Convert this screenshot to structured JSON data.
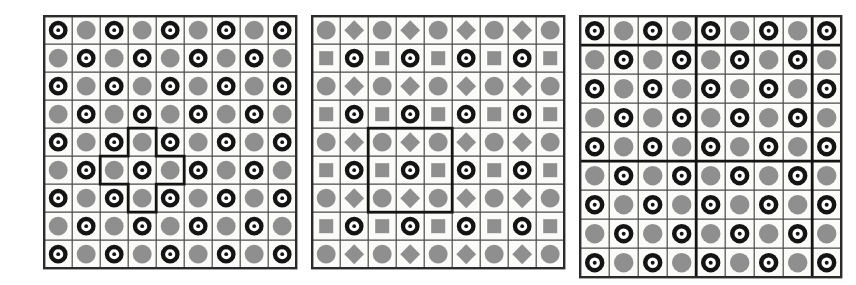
{
  "figure": {
    "background_color": "#ffffff",
    "width": 856,
    "height": 285
  },
  "palette": {
    "ink": "#1a1a1a",
    "thin_line": "#4a4a4a",
    "thick_line": "#141414",
    "panel_border": "#2b2b2b",
    "cell_background": "#fbfbfa",
    "gray_fill": "#8f8f8f",
    "gray_fill_dark": "#858585",
    "ring_stroke": "#141414",
    "ring_inner": "#ffffff",
    "dot_fill": "#141414"
  },
  "glyphs": {
    "ring_dot": {
      "name": "ring-dot-glyph",
      "description": "Thick black annulus with white interior and small black center dot"
    },
    "gray_circle": {
      "name": "gray-circle-glyph",
      "description": "Solid medium gray filled circle"
    },
    "gray_square": {
      "name": "gray-square-glyph",
      "description": "Solid medium gray filled square"
    },
    "gray_diamond": {
      "name": "gray-diamond-glyph",
      "description": "Solid medium gray filled diamond (rotated square)"
    }
  },
  "panels": [
    {
      "id": "panel-left",
      "label": "Left grid",
      "x": 42,
      "y": 14,
      "cell": 28,
      "rows": 9,
      "cols": 9,
      "thin_line_width": 1.2,
      "border_width": 2.4,
      "thick_line_width": 0,
      "thick_rows": [],
      "thick_cols": [],
      "cells": [
        [
          "ring_dot",
          "gray_circle",
          "ring_dot",
          "gray_circle",
          "ring_dot",
          "gray_circle",
          "ring_dot",
          "gray_circle",
          "ring_dot"
        ],
        [
          "gray_circle",
          "ring_dot",
          "gray_circle",
          "ring_dot",
          "gray_circle",
          "ring_dot",
          "gray_circle",
          "ring_dot",
          "gray_circle"
        ],
        [
          "ring_dot",
          "gray_circle",
          "ring_dot",
          "gray_circle",
          "ring_dot",
          "gray_circle",
          "ring_dot",
          "gray_circle",
          "ring_dot"
        ],
        [
          "gray_circle",
          "ring_dot",
          "gray_circle",
          "ring_dot",
          "gray_circle",
          "ring_dot",
          "gray_circle",
          "ring_dot",
          "gray_circle"
        ],
        [
          "ring_dot",
          "gray_circle",
          "ring_dot",
          "gray_circle",
          "ring_dot",
          "gray_circle",
          "ring_dot",
          "gray_circle",
          "ring_dot"
        ],
        [
          "gray_circle",
          "ring_dot",
          "gray_circle",
          "ring_dot",
          "gray_circle",
          "ring_dot",
          "gray_circle",
          "ring_dot",
          "gray_circle"
        ],
        [
          "ring_dot",
          "gray_circle",
          "ring_dot",
          "gray_circle",
          "ring_dot",
          "gray_circle",
          "ring_dot",
          "gray_circle",
          "ring_dot"
        ],
        [
          "gray_circle",
          "ring_dot",
          "gray_circle",
          "ring_dot",
          "gray_circle",
          "ring_dot",
          "gray_circle",
          "ring_dot",
          "gray_circle"
        ],
        [
          "ring_dot",
          "gray_circle",
          "ring_dot",
          "gray_circle",
          "ring_dot",
          "gray_circle",
          "ring_dot",
          "gray_circle",
          "ring_dot"
        ]
      ],
      "highlight": {
        "name": "plus-shape-outline",
        "shape": "plus",
        "stroke_width": 2.8,
        "description": "Bold plus/cross outline covering the center cell, the cell above, the cell below, and the cells left and right",
        "cells": [
          [
            4,
            3
          ],
          [
            5,
            2
          ],
          [
            5,
            3
          ],
          [
            5,
            4
          ],
          [
            6,
            3
          ]
        ]
      }
    },
    {
      "id": "panel-middle",
      "label": "Middle grid",
      "x": 310,
      "y": 14,
      "cell": 28,
      "rows": 9,
      "cols": 9,
      "thin_line_width": 1.2,
      "border_width": 2.4,
      "thick_line_width": 0,
      "thick_rows": [],
      "thick_cols": [],
      "cells": [
        [
          "gray_circle",
          "gray_diamond",
          "gray_circle",
          "gray_diamond",
          "gray_circle",
          "gray_diamond",
          "gray_circle",
          "gray_diamond",
          "gray_circle"
        ],
        [
          "gray_square",
          "ring_dot",
          "gray_square",
          "ring_dot",
          "gray_square",
          "ring_dot",
          "gray_square",
          "ring_dot",
          "gray_square"
        ],
        [
          "gray_circle",
          "gray_diamond",
          "gray_circle",
          "gray_diamond",
          "gray_circle",
          "gray_diamond",
          "gray_circle",
          "gray_diamond",
          "gray_circle"
        ],
        [
          "gray_square",
          "ring_dot",
          "gray_square",
          "ring_dot",
          "gray_square",
          "ring_dot",
          "gray_square",
          "ring_dot",
          "gray_square"
        ],
        [
          "gray_circle",
          "gray_diamond",
          "gray_circle",
          "gray_diamond",
          "gray_circle",
          "gray_diamond",
          "gray_circle",
          "gray_diamond",
          "gray_circle"
        ],
        [
          "gray_square",
          "ring_dot",
          "gray_square",
          "ring_dot",
          "gray_square",
          "ring_dot",
          "gray_square",
          "ring_dot",
          "gray_square"
        ],
        [
          "gray_circle",
          "gray_diamond",
          "gray_circle",
          "gray_diamond",
          "gray_circle",
          "gray_diamond",
          "gray_circle",
          "gray_diamond",
          "gray_circle"
        ],
        [
          "gray_square",
          "ring_dot",
          "gray_square",
          "ring_dot",
          "gray_square",
          "ring_dot",
          "gray_square",
          "ring_dot",
          "gray_square"
        ],
        [
          "gray_circle",
          "gray_diamond",
          "gray_circle",
          "gray_diamond",
          "gray_circle",
          "gray_diamond",
          "gray_circle",
          "gray_diamond",
          "gray_circle"
        ]
      ],
      "highlight": {
        "name": "square-block-outline",
        "shape": "rect",
        "stroke_width": 2.8,
        "description": "Bold 3 by 3 square outline over rows 5 to 7 and columns 3 to 5",
        "row_start": 4,
        "col_start": 2,
        "row_span": 3,
        "col_span": 3
      }
    },
    {
      "id": "panel-right",
      "label": "Right grid",
      "x": 578,
      "y": 14,
      "cell": 29,
      "rows": 9,
      "cols": 9,
      "thin_line_width": 1.2,
      "border_width": 2.4,
      "thick_line_width": 2.8,
      "thick_rows": [
        1,
        5
      ],
      "thick_cols": [
        4,
        8
      ],
      "cells": [
        [
          "ring_dot",
          "gray_circle",
          "ring_dot",
          "gray_circle",
          "ring_dot",
          "gray_circle",
          "ring_dot",
          "gray_circle",
          "ring_dot"
        ],
        [
          "gray_circle",
          "ring_dot",
          "gray_circle",
          "ring_dot",
          "gray_circle",
          "ring_dot",
          "gray_circle",
          "ring_dot",
          "gray_circle"
        ],
        [
          "ring_dot",
          "gray_circle",
          "ring_dot",
          "gray_circle",
          "ring_dot",
          "gray_circle",
          "ring_dot",
          "gray_circle",
          "ring_dot"
        ],
        [
          "gray_circle",
          "ring_dot",
          "gray_circle",
          "ring_dot",
          "gray_circle",
          "ring_dot",
          "gray_circle",
          "ring_dot",
          "gray_circle"
        ],
        [
          "ring_dot",
          "gray_circle",
          "ring_dot",
          "gray_circle",
          "ring_dot",
          "gray_circle",
          "ring_dot",
          "gray_circle",
          "ring_dot"
        ],
        [
          "gray_circle",
          "ring_dot",
          "gray_circle",
          "ring_dot",
          "gray_circle",
          "ring_dot",
          "gray_circle",
          "ring_dot",
          "gray_circle"
        ],
        [
          "ring_dot",
          "gray_circle",
          "ring_dot",
          "gray_circle",
          "ring_dot",
          "gray_circle",
          "ring_dot",
          "gray_circle",
          "ring_dot"
        ],
        [
          "gray_circle",
          "ring_dot",
          "gray_circle",
          "ring_dot",
          "gray_circle",
          "ring_dot",
          "gray_circle",
          "ring_dot",
          "gray_circle"
        ],
        [
          "ring_dot",
          "gray_circle",
          "ring_dot",
          "gray_circle",
          "ring_dot",
          "gray_circle",
          "ring_dot",
          "gray_circle",
          "ring_dot"
        ]
      ],
      "highlight": null
    }
  ]
}
